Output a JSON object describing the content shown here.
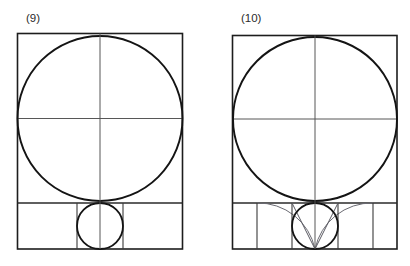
{
  "document": {
    "background_color": "#ffffff",
    "ink_color": "#1d1d1d",
    "construction_color": "#6a6a72",
    "width": 410,
    "height": 266,
    "description": "Two line-drawn geometric constructions of a circle inscribed in a square above a subdivided base strip"
  },
  "figures": [
    {
      "id": "figure-9",
      "label": "(9)",
      "label_x": 26,
      "label_y": 22,
      "frame": {
        "x": 17.5,
        "y": 33.5,
        "width": 165,
        "height": 215.5
      },
      "upper_square": {
        "x": 17.5,
        "y": 33.5,
        "width": 165,
        "height": 169.5
      },
      "major_circle": {
        "cx": 100,
        "cy": 118.5,
        "r": 82.5
      },
      "vertical_axis": {
        "x": 100,
        "y1": 33.5,
        "y2": 249
      },
      "horizontal_axis": {
        "y": 118.5,
        "x1": 17.5,
        "x2": 182.5
      },
      "base_strip": {
        "y_top": 203,
        "y_bottom": 249
      },
      "base_square": {
        "x": 77,
        "y": 203,
        "width": 46,
        "height": 46
      },
      "minor_circle": {
        "cx": 100,
        "cy": 226,
        "r": 23
      },
      "base_dividers_x": [
        77,
        123
      ],
      "construction_arcs": [],
      "construction_rays": []
    },
    {
      "id": "figure-10",
      "label": "(10)",
      "label_x": 241,
      "label_y": 22,
      "frame": {
        "x": 232.5,
        "y": 35.5,
        "width": 164.5,
        "height": 213.5
      },
      "upper_square": {
        "x": 232.5,
        "y": 35.5,
        "width": 164.5,
        "height": 167.5
      },
      "major_circle": {
        "cx": 315,
        "cy": 119,
        "r": 82
      },
      "vertical_axis": {
        "x": 315,
        "y1": 35.5,
        "y2": 249
      },
      "horizontal_axis": {
        "y": 119,
        "x1": 232.5,
        "x2": 397
      },
      "base_strip": {
        "y_top": 203,
        "y_bottom": 249
      },
      "base_square": {
        "x": 292,
        "y": 203,
        "width": 46,
        "height": 46
      },
      "minor_circle": {
        "cx": 315,
        "cy": 226,
        "r": 23
      },
      "base_dividers_x": [
        257,
        292,
        338,
        373
      ],
      "construction_arcs": [
        {
          "from_x": 315,
          "from_y": 249,
          "to_x": 257,
          "to_y": 203,
          "radius": 58,
          "sweep": 0
        },
        {
          "from_x": 315,
          "from_y": 249,
          "to_x": 373,
          "to_y": 203,
          "radius": 58,
          "sweep": 1
        }
      ],
      "construction_rays": [
        {
          "x1": 315,
          "y1": 249,
          "x2": 292,
          "y2": 203
        },
        {
          "x1": 315,
          "y1": 249,
          "x2": 338,
          "y2": 203
        }
      ]
    }
  ],
  "chart_data": {
    "type": "diagram",
    "panels": [
      {
        "label": "(9)",
        "elements": [
          "outer rectangle",
          "inscribed major circle",
          "vertical center axis",
          "horizontal center axis",
          "base strip divided into 3 cells",
          "inscribed minor circle in central base cell"
        ]
      },
      {
        "label": "(10)",
        "elements": [
          "outer rectangle",
          "inscribed major circle",
          "vertical center axis",
          "horizontal center axis",
          "base strip divided into 5 cells",
          "inscribed minor circle in central base cell",
          "two construction arcs from base midpoint",
          "two construction rays from base midpoint"
        ]
      }
    ]
  }
}
